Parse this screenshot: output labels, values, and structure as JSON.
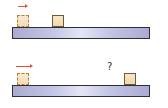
{
  "diagram": {
    "panels": [
      {
        "id": "initial-state",
        "arrow": {
          "direction": "right",
          "color": "#e0503c"
        },
        "ghost_block": {
          "style": "dashed",
          "color": "#f2dcb4"
        },
        "block": {
          "color": "#f0d7a8"
        },
        "board": {
          "color": "#c4c6e6"
        }
      },
      {
        "id": "final-state",
        "arrow": {
          "direction": "right",
          "color": "#e0503c"
        },
        "ghost_block": {
          "style": "dashed",
          "color": "#f2dcb4"
        },
        "block": {
          "color": "#f0d7a8"
        },
        "board": {
          "color": "#c4c6e6"
        },
        "question_label": "?"
      }
    ]
  }
}
